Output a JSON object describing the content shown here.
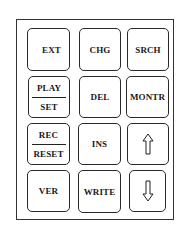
{
  "keypad": {
    "keys": [
      {
        "id": "ext",
        "label": "EXT"
      },
      {
        "id": "chg",
        "label": "CHG"
      },
      {
        "id": "srch",
        "label": "SRCH"
      },
      {
        "id": "play-set",
        "top": "PLAY",
        "bottom": "SET"
      },
      {
        "id": "del",
        "label": "DEL"
      },
      {
        "id": "montr",
        "label": "MONTR"
      },
      {
        "id": "rec-reset",
        "top": "REC",
        "bottom": "RESET"
      },
      {
        "id": "ins",
        "label": "INS"
      },
      {
        "id": "up",
        "icon": "up-arrow-icon"
      },
      {
        "id": "ver",
        "label": "VER"
      },
      {
        "id": "write",
        "label": "WRITE"
      },
      {
        "id": "down",
        "icon": "down-arrow-icon"
      }
    ]
  },
  "colors": {
    "stroke": "#2a2a2a",
    "background": "#ffffff"
  }
}
